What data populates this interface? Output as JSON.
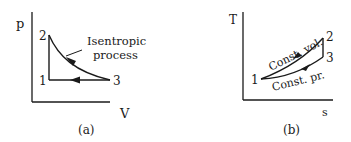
{
  "figure_a": {
    "caption": "(a)",
    "y_axis_label": "p",
    "x_axis_label": "V",
    "points": [
      {
        "id": "1",
        "label": "1"
      },
      {
        "id": "2",
        "label": "2"
      },
      {
        "id": "3",
        "label": "3"
      }
    ],
    "annotation_line1": "Isentropic",
    "annotation_line2": "process",
    "processes": [
      {
        "from": "2",
        "to": "3",
        "type": "Isentropic process"
      },
      {
        "from": "3",
        "to": "1",
        "type": "Constant pressure"
      },
      {
        "from": "1",
        "to": "2",
        "type": "Constant volume"
      }
    ]
  },
  "figure_b": {
    "caption": "(b)",
    "y_axis_label": "T",
    "x_axis_label": "s",
    "points": [
      {
        "id": "1",
        "label": "1"
      },
      {
        "id": "2",
        "label": "2"
      },
      {
        "id": "3",
        "label": "3"
      }
    ],
    "upper_curve_label": "Const. vol.",
    "lower_curve_label": "Const. pr.",
    "processes": [
      {
        "from": "1",
        "to": "2",
        "type": "Const. vol."
      },
      {
        "from": "2",
        "to": "3",
        "type": "Isentropic"
      },
      {
        "from": "3",
        "to": "1",
        "type": "Const. pr."
      }
    ]
  },
  "colors": {
    "ink": "#1a1a1a",
    "background": "#ffffff"
  }
}
